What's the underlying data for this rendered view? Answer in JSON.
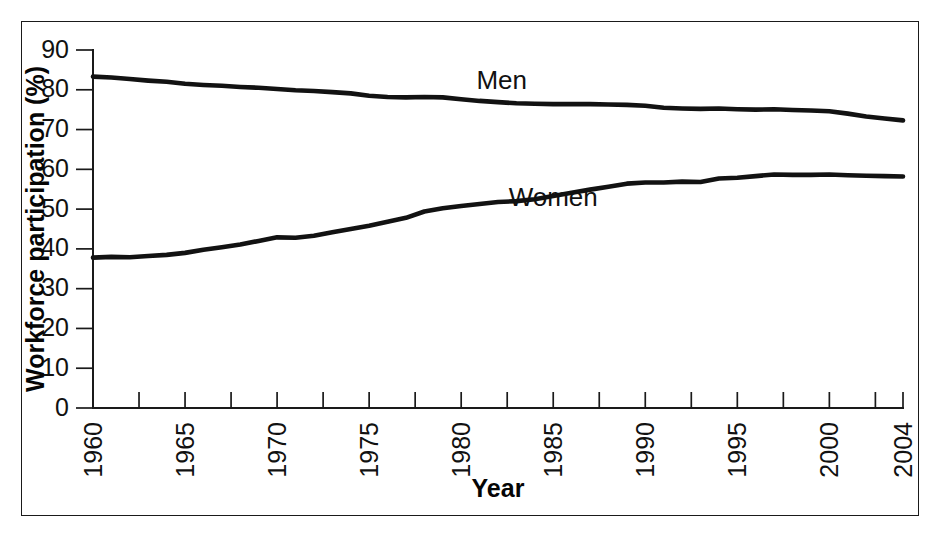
{
  "chart_data": {
    "type": "line",
    "title": "",
    "xlabel": "Year",
    "ylabel": "Workforce participation (%)",
    "xlim": [
      1960,
      2004
    ],
    "ylim": [
      0,
      90
    ],
    "grid": false,
    "legend_position": "inline-labels",
    "y_ticks": [
      0,
      10,
      20,
      30,
      40,
      50,
      60,
      70,
      80,
      90
    ],
    "y_tick_labels": [
      "0",
      "10",
      "20",
      "30",
      "40",
      "50",
      "60",
      "70",
      "80",
      "90"
    ],
    "x_ticks": [
      1960,
      1965,
      1970,
      1975,
      1980,
      1985,
      1990,
      1995,
      2000,
      2004
    ],
    "x_tick_labels": [
      "1960",
      "1965",
      "1970",
      "1975",
      "1980",
      "1985",
      "1990",
      "1995",
      "2000",
      "2004"
    ],
    "x_minor_tick_step": 2.5,
    "x": [
      1960,
      1961,
      1962,
      1963,
      1964,
      1965,
      1966,
      1967,
      1968,
      1969,
      1970,
      1971,
      1972,
      1973,
      1974,
      1975,
      1976,
      1977,
      1978,
      1979,
      1980,
      1981,
      1982,
      1983,
      1984,
      1985,
      1986,
      1987,
      1988,
      1989,
      1990,
      1991,
      1992,
      1993,
      1994,
      1995,
      1996,
      1997,
      1998,
      1999,
      2000,
      2001,
      2002,
      2003,
      2004
    ],
    "series": [
      {
        "name": "Men",
        "label": "Men",
        "color": "#121212",
        "values": [
          83.3,
          83.1,
          82.7,
          82.3,
          82.0,
          81.5,
          81.2,
          81.0,
          80.7,
          80.5,
          80.2,
          79.9,
          79.7,
          79.4,
          79.1,
          78.5,
          78.2,
          78.1,
          78.2,
          78.1,
          77.6,
          77.2,
          76.9,
          76.6,
          76.5,
          76.4,
          76.4,
          76.4,
          76.3,
          76.2,
          76.0,
          75.5,
          75.3,
          75.2,
          75.3,
          75.1,
          75.0,
          75.1,
          74.9,
          74.8,
          74.6,
          74.0,
          73.3,
          72.8,
          72.3
        ]
      },
      {
        "name": "Women",
        "label": "Women",
        "color": "#121212",
        "values": [
          37.8,
          38.0,
          37.9,
          38.2,
          38.5,
          39.0,
          39.8,
          40.4,
          41.1,
          42.0,
          42.9,
          42.8,
          43.3,
          44.2,
          45.0,
          45.8,
          46.8,
          47.8,
          49.4,
          50.2,
          50.8,
          51.3,
          51.8,
          52.0,
          52.5,
          53.3,
          54.1,
          54.9,
          55.6,
          56.4,
          56.7,
          56.7,
          56.9,
          56.8,
          57.7,
          57.9,
          58.3,
          58.7,
          58.6,
          58.6,
          58.7,
          58.5,
          58.4,
          58.3,
          58.2
        ]
      }
    ],
    "annotations": [
      {
        "text": "Men",
        "x": 1982.2,
        "y": 80.2
      },
      {
        "text": "Women",
        "x": 1985.0,
        "y": 50.8
      }
    ]
  },
  "axis_titles": {
    "x": "Year",
    "y": "Workforce participation (%)"
  }
}
